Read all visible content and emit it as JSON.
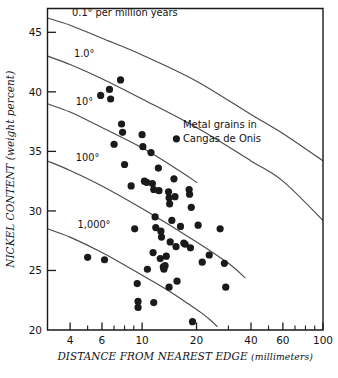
{
  "chart_data": {
    "type": "scatter",
    "title": "",
    "xlabel": "DISTANCE FROM NEAREST EDGE (millimeters)",
    "xlabel_main": "DISTANCE FROM NEAREST EDGE",
    "xlabel_unit": "(millimeters)",
    "ylabel": "NICKEL CONTENT (weight percent)",
    "xscale": "log",
    "yscale": "linear",
    "xlim": [
      3,
      100
    ],
    "ylim": [
      20,
      47
    ],
    "grid": false,
    "legend_position": "inside-upper-right",
    "xticks": [
      4,
      6,
      10,
      20,
      40,
      60,
      100
    ],
    "xticklabels": [
      "4",
      "6",
      "10",
      "20",
      "40",
      "60",
      "100"
    ],
    "xticks_minor": [
      3,
      5,
      7,
      8,
      9,
      30,
      50,
      70,
      80,
      90
    ],
    "yticks": [
      20,
      25,
      30,
      35,
      40,
      45
    ],
    "yticklabels": [
      "20",
      "25",
      "30",
      "35",
      "40",
      "45"
    ],
    "series": [
      {
        "name": "Metal grains in Cangas de Onis",
        "marker": "filled-circle",
        "color": "#1a1a1a",
        "points": [
          [
            5.0,
            26.1
          ],
          [
            6.2,
            25.9
          ],
          [
            5.9,
            39.7
          ],
          [
            6.6,
            40.2
          ],
          [
            6.7,
            39.4
          ],
          [
            7.6,
            41.0
          ],
          [
            7.0,
            35.6
          ],
          [
            7.7,
            37.3
          ],
          [
            7.8,
            36.6
          ],
          [
            8.0,
            33.9
          ],
          [
            8.7,
            32.1
          ],
          [
            9.1,
            28.5
          ],
          [
            9.4,
            23.9
          ],
          [
            9.5,
            22.4
          ],
          [
            9.5,
            21.9
          ],
          [
            10.0,
            36.4
          ],
          [
            10.1,
            35.4
          ],
          [
            10.3,
            32.5
          ],
          [
            10.6,
            32.4
          ],
          [
            10.7,
            25.1
          ],
          [
            11.2,
            34.9
          ],
          [
            11.4,
            32.3
          ],
          [
            11.6,
            31.8
          ],
          [
            11.8,
            29.5
          ],
          [
            11.9,
            28.6
          ],
          [
            11.5,
            26.5
          ],
          [
            11.6,
            22.3
          ],
          [
            12.3,
            33.6
          ],
          [
            12.4,
            31.7
          ],
          [
            12.7,
            28.3
          ],
          [
            12.8,
            27.8
          ],
          [
            12.6,
            26.0
          ],
          [
            13.1,
            25.3
          ],
          [
            13.2,
            25.1
          ],
          [
            13.4,
            25.4
          ],
          [
            13.6,
            26.2
          ],
          [
            14.0,
            31.6
          ],
          [
            14.1,
            31.1
          ],
          [
            14.2,
            30.6
          ],
          [
            14.3,
            27.4
          ],
          [
            14.1,
            23.6
          ],
          [
            14.6,
            29.2
          ],
          [
            15.0,
            32.7
          ],
          [
            15.2,
            31.2
          ],
          [
            15.4,
            27.0
          ],
          [
            15.6,
            24.1
          ],
          [
            16.3,
            28.7
          ],
          [
            17.0,
            27.3
          ],
          [
            17.3,
            27.2
          ],
          [
            18.2,
            31.8
          ],
          [
            18.3,
            31.4
          ],
          [
            18.7,
            30.3
          ],
          [
            18.5,
            26.9
          ],
          [
            19.0,
            20.7
          ],
          [
            20.4,
            28.8
          ],
          [
            21.5,
            25.7
          ],
          [
            23.5,
            26.3
          ],
          [
            27.0,
            28.5
          ],
          [
            28.5,
            25.6
          ],
          [
            29.0,
            23.6
          ]
        ]
      }
    ],
    "curves": [
      {
        "label": "0.1° per million years",
        "label_x": 4.1,
        "label_y": 46.4,
        "points": [
          [
            3,
            46.2
          ],
          [
            4,
            45.6
          ],
          [
            6,
            44.5
          ],
          [
            10,
            43.1
          ],
          [
            20,
            40.9
          ],
          [
            40,
            38.1
          ],
          [
            60,
            36.5
          ],
          [
            100,
            34.2
          ]
        ]
      },
      {
        "label": "1.0°",
        "label_x": 4.2,
        "label_y": 42.9,
        "points": [
          [
            3,
            43.0
          ],
          [
            4,
            42.3
          ],
          [
            6,
            41.1
          ],
          [
            10,
            39.4
          ],
          [
            20,
            37.0
          ],
          [
            40,
            34.2
          ],
          [
            60,
            32.5
          ],
          [
            100,
            29.2
          ]
        ]
      },
      {
        "label": "10°",
        "label_x": 4.3,
        "label_y": 38.9,
        "points": [
          [
            3,
            39.0
          ],
          [
            4,
            38.3
          ],
          [
            6,
            37.0
          ],
          [
            10,
            35.3
          ],
          [
            16,
            33.4
          ],
          [
            20,
            32.4
          ]
        ]
      },
      {
        "label": "100°",
        "label_x": 4.3,
        "label_y": 34.2,
        "points": [
          [
            3,
            34.2
          ],
          [
            4,
            33.4
          ],
          [
            6,
            32.1
          ],
          [
            10,
            30.2
          ],
          [
            20,
            27.4
          ],
          [
            30,
            25.6
          ],
          [
            37,
            24.4
          ]
        ]
      },
      {
        "label": "1,000°",
        "label_x": 4.4,
        "label_y": 28.6,
        "points": [
          [
            3,
            28.5
          ],
          [
            4,
            27.8
          ],
          [
            6,
            26.5
          ],
          [
            10,
            24.6
          ],
          [
            14,
            23.3
          ],
          [
            18,
            22.2
          ],
          [
            21,
            21.5
          ],
          [
            24,
            20.8
          ],
          [
            26,
            20.3
          ]
        ]
      }
    ],
    "legend": {
      "line1": "Metal grains in",
      "line2": "Cangas de Onis",
      "marker": "filled-circle"
    }
  }
}
